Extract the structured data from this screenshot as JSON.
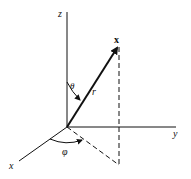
{
  "figure": {
    "type": "spherical-coordinates",
    "axes": {
      "z_label": "z",
      "y_label": "y",
      "x_label": "x"
    },
    "vector": {
      "point_label": "x",
      "length_label": "r"
    },
    "angles": {
      "polar_label": "θ",
      "azimuth_label": "φ"
    },
    "colors": {
      "ink": "#111111",
      "background": "#ffffff"
    }
  }
}
